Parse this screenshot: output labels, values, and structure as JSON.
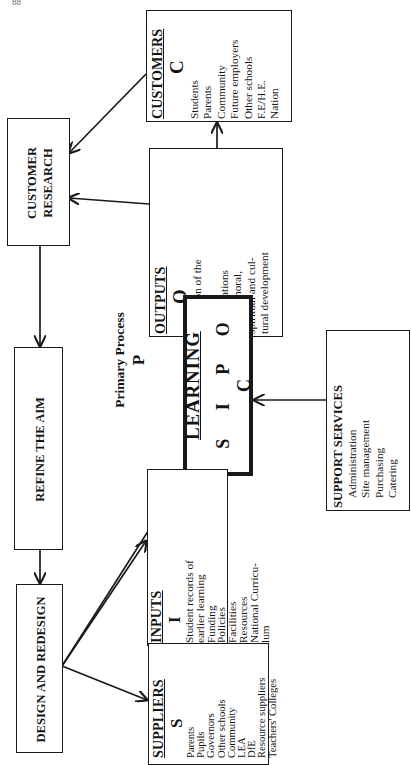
{
  "page_number": "88",
  "diagram": {
    "type": "SIPOC process flow (rotated 90° counter-clockwise)",
    "primary_process": {
      "label": "Primary Process",
      "letter": "P",
      "title": "LEARNING",
      "acronym": "S I P O C"
    },
    "suppliers": {
      "title": "SUPPLIERS",
      "letter": "S",
      "items": [
        "Parents",
        "Pupils",
        "Governors",
        "Other schools",
        "Community",
        "LEA",
        "DfE",
        "Resource suppliers",
        "Teachers' Colleges"
      ]
    },
    "inputs": {
      "title": "INPUTS",
      "letter": "I",
      "items": [
        "Student records of",
        "earlier learning",
        "Funding",
        "Policies",
        "Facilities",
        "Resources",
        "National Curricu-",
        "lum"
      ]
    },
    "outputs": {
      "title": "OUTPUTS",
      "letter": "O",
      "items": [
        "Education of the",
        "student",
        "Qualifications",
        "Social, moral,",
        "spiritual and cul-",
        "tural development"
      ]
    },
    "customers": {
      "title": "CUSTOMERS",
      "letter": "C",
      "items": [
        "Students",
        "Parents",
        "Community",
        "Future employers",
        "Other schools",
        "F.E/H.E.",
        "Nation"
      ]
    },
    "support_services": {
      "title": "SUPPORT SERVICES",
      "items": [
        "Administration",
        "Site management",
        "Purchasing",
        "Catering"
      ]
    },
    "feedback_loop": {
      "customer_research": [
        "CUSTOMER",
        "RESEARCH"
      ],
      "refine_the_aim": "REFINE THE AIM",
      "design_and_redesign": "DESIGN AND REDESIGN"
    },
    "connections": [
      {
        "from": "suppliers",
        "to": "inputs"
      },
      {
        "from": "inputs",
        "to": "learning"
      },
      {
        "from": "learning",
        "to": "outputs"
      },
      {
        "from": "outputs",
        "to": "customers"
      },
      {
        "from": "support_services",
        "to": "learning"
      },
      {
        "from": "customers",
        "to": "customer_research"
      },
      {
        "from": "outputs",
        "to": "customer_research"
      },
      {
        "from": "customer_research",
        "to": "refine_the_aim"
      },
      {
        "from": "refine_the_aim",
        "to": "design_and_redesign"
      },
      {
        "from": "design_and_redesign",
        "to": "suppliers"
      },
      {
        "from": "design_and_redesign",
        "to": "inputs"
      },
      {
        "from": "design_and_redesign",
        "to": "learning"
      }
    ]
  }
}
